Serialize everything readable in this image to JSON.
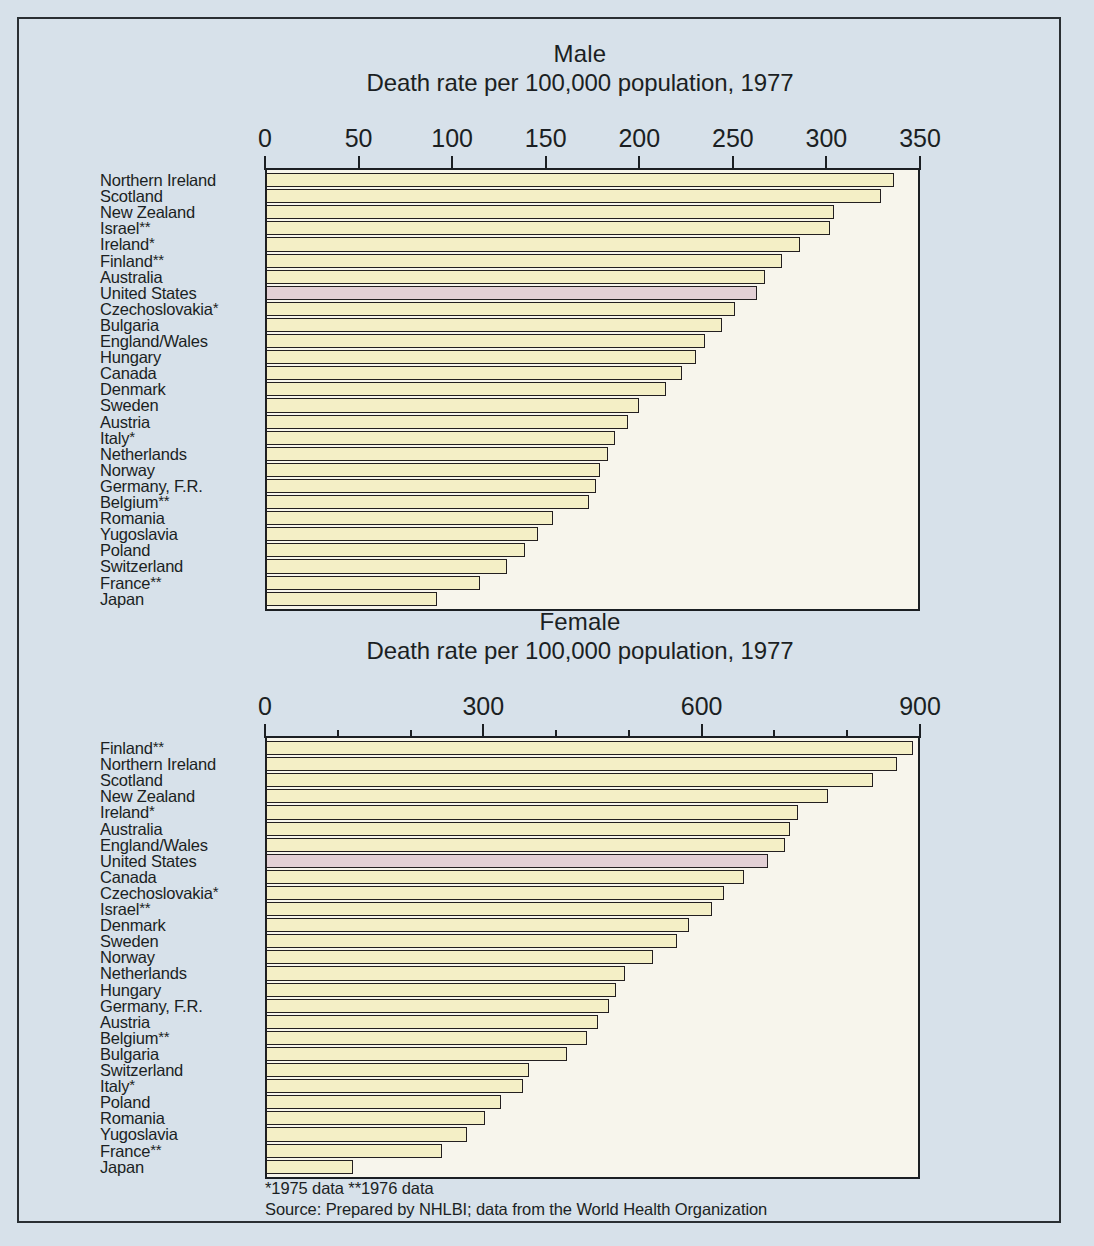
{
  "chart_data": [
    {
      "type": "bar",
      "orientation": "horizontal",
      "id": "male",
      "title": "Male",
      "subtitle": "Death rate per 100,000 population, 1977",
      "xlabel": "Death rate per 100,000 population, 1977",
      "ylabel": "",
      "xlim": [
        0,
        350
      ],
      "xticks": [
        0,
        50,
        100,
        150,
        200,
        250,
        300,
        350
      ],
      "xtick_labels": [
        "0",
        "50",
        "100",
        "150",
        "200",
        "250",
        "300",
        "350"
      ],
      "grid": false,
      "legend": "none",
      "highlight_category": "United States",
      "highlight_color": "#e3d0d5",
      "bar_color": "#f4efc6",
      "categories": [
        "Northern Ireland",
        "Scotland",
        "New Zealand",
        "Israel**",
        "Ireland*",
        "Finland**",
        "Australia",
        "United States",
        "Czechoslovakia*",
        "Bulgaria",
        "England/Wales",
        "Hungary",
        "Canada",
        "Denmark",
        "Sweden",
        "Austria",
        "Italy*",
        "Netherlands",
        "Norway",
        "Germany, F.R.",
        "Belgium**",
        "Romania",
        "Yugoslavia",
        "Poland",
        "Switzerland",
        "France**",
        "Japan"
      ],
      "values": [
        335,
        328,
        303,
        301,
        285,
        275,
        266,
        262,
        250,
        243,
        234,
        229,
        222,
        213,
        199,
        193,
        186,
        182,
        178,
        176,
        172,
        153,
        145,
        138,
        128,
        114,
        91
      ]
    },
    {
      "type": "bar",
      "orientation": "horizontal",
      "id": "female",
      "title": "Female",
      "subtitle": "Death rate per 100,000 population, 1977",
      "xlabel": "Death rate per 100,000 population, 1977",
      "ylabel": "",
      "xlim": [
        0,
        900
      ],
      "xticks": [
        0,
        100,
        200,
        300,
        400,
        500,
        600,
        700,
        800,
        900
      ],
      "xtick_labels": [
        "0",
        "300",
        "600",
        "900"
      ],
      "labeled_xticks": [
        0,
        300,
        600,
        900
      ],
      "grid": false,
      "legend": "none",
      "highlight_category": "United States",
      "highlight_color": "#e3d0d5",
      "bar_color": "#f4efc6",
      "categories": [
        "Finland**",
        "Northern Ireland",
        "Scotland",
        "New Zealand",
        "Ireland*",
        "Australia",
        "England/Wales",
        "United States",
        "Canada",
        "Czechoslovakia*",
        "Israel**",
        "Denmark",
        "Sweden",
        "Norway",
        "Netherlands",
        "Hungary",
        "Germany, F.R.",
        "Austria",
        "Belgium**",
        "Bulgaria",
        "Switzerland",
        "Italy*",
        "Poland",
        "Romania",
        "Yugoslavia",
        "France**",
        "Japan"
      ],
      "values": [
        888,
        866,
        832,
        771,
        730,
        718,
        712,
        688,
        655,
        628,
        612,
        580,
        563,
        530,
        492,
        480,
        470,
        455,
        440,
        412,
        360,
        352,
        322,
        300,
        275,
        240,
        118
      ]
    }
  ],
  "charts": [
    {
      "sex_title": "Male",
      "subtitle": "Death rate per 100,000 population, 1977"
    },
    {
      "sex_title": "Female",
      "subtitle": "Death rate per 100,000 population, 1977"
    }
  ],
  "footnotes": {
    "line1": "*1975 data **1976 data",
    "line2": "Source: Prepared by NHLBI; data from the World Health Organization"
  }
}
